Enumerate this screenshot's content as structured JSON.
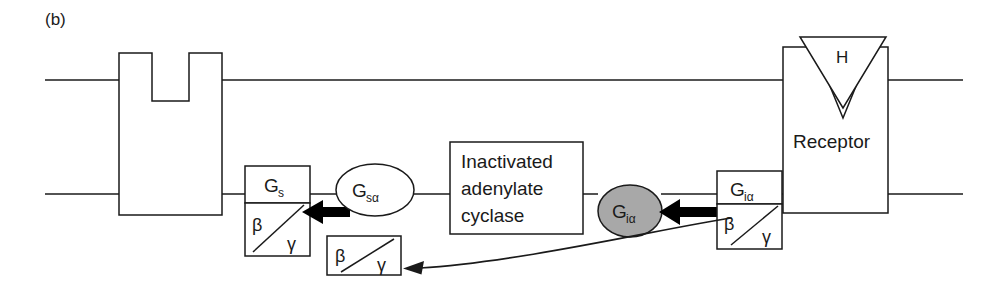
{
  "figure": {
    "panel_label": "(b)",
    "caption_context": "G-protein signalling at the plasma membrane with inactivated adenylate cyclase"
  },
  "membrane": {
    "top_line_label": "membrane-outer-leaflet",
    "bottom_line_label": "membrane-inner-leaflet"
  },
  "ion_channel": {
    "label": ""
  },
  "gs_complex": {
    "alpha_label": "G",
    "alpha_subscript": "s",
    "beta_label": "β",
    "gamma_label": "γ"
  },
  "gs_alpha_free": {
    "label": "G",
    "subscript": "sα"
  },
  "cyclase": {
    "line1": "Inactivated",
    "line2": "adenylate",
    "line3": "cyclase"
  },
  "gi_alpha_free": {
    "label": "G",
    "subscript": "iα",
    "fill": "#a8a8a8"
  },
  "gi_complex": {
    "alpha_label": "G",
    "alpha_subscript": "iα",
    "beta_label": "β",
    "gamma_label": "γ"
  },
  "beta_gamma_free": {
    "beta_label": "β",
    "gamma_label": "γ"
  },
  "receptor": {
    "label": "Receptor",
    "hormone_label": "H"
  },
  "arrows": {
    "gs_dissociation": "bold-left-arrow",
    "gi_dissociation": "bold-left-arrow",
    "betagamma_release": "curved-left-arrow"
  },
  "colors": {
    "ink": "#1a1a1a",
    "gray_fill": "#a8a8a8",
    "white_fill": "#ffffff",
    "bold_arrow": "#000000"
  }
}
